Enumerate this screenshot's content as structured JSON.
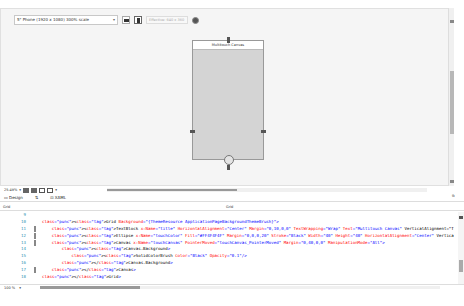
{
  "toolbar": {
    "device": "5\" Phone (1920 x 1080) 300% scale",
    "effective_size": "Effective: 640 x 360",
    "orientation": [
      "landscape",
      "portrait"
    ]
  },
  "designer": {
    "canvas_title": "Multitouch Canvas",
    "zoom": "25.49%"
  },
  "tabs": {
    "design": "Design",
    "swap": "⇅",
    "xaml": "XAML",
    "swap_panes": "⧉"
  },
  "grid_bar": {
    "left": "Grid",
    "right": "Grid"
  },
  "code": {
    "lines": [
      {
        "n": "9",
        "text": ""
      },
      {
        "n": "10",
        "text": "<Grid Background=\"{ThemeResource ApplicationPageBackgroundThemeBrush}\">"
      },
      {
        "n": "11",
        "text": "    <TextBlock x:Name=\"title\" HorizontalAlignment=\"Center\" Margin=\"0,10,0,0\" TextWrapping=\"Wrap\" Text=\"Multitouch Canvas\" VerticalAlignment=\"T"
      },
      {
        "n": "12",
        "text": "    <Ellipse x:Name=\"touchColor\" Fill=\"#FF4F4F4F\" Margin=\"0,0,0,20\" Stroke=\"Black\" Width=\"40\" Height=\"40\" HorizontalAlignment=\"Center\" Vertica"
      },
      {
        "n": "13",
        "text": "    <Canvas x:Name=\"touchCanvas\" PointerMoved=\"touchCanvas_PointerMoved\" Margin=\"0,40,0,0\" ManipulationMode=\"All\">"
      },
      {
        "n": "14",
        "text": "        <Canvas.Background>"
      },
      {
        "n": "15",
        "text": "            <SolidColorBrush Color=\"Black\" Opacity=\"0.1\"/>"
      },
      {
        "n": "16",
        "text": "        </Canvas.Background>"
      },
      {
        "n": "17",
        "text": "    </Canvas>"
      },
      {
        "n": "18",
        "text": "</Grid>"
      }
    ]
  },
  "status": {
    "zoom": "100 %"
  }
}
